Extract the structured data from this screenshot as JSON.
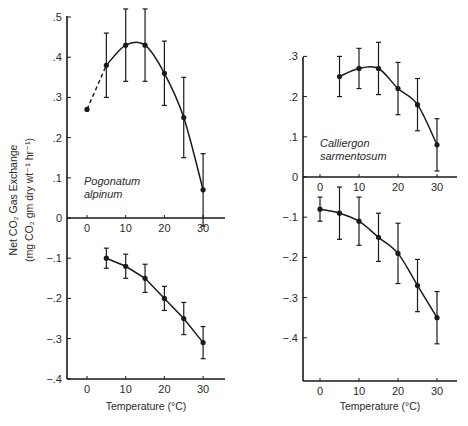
{
  "figure": {
    "ylabel_line1": "Net CO₂ Gas Exchange",
    "ylabel_line2": "(mg CO₂ gm dry wt⁻¹ hr⁻¹)",
    "xlabel": "Temperature (°C)"
  },
  "chart_data": [
    {
      "type": "line",
      "panel": "left",
      "title": "Pogonatum alpinum",
      "species_line1": "Pogonatum",
      "species_line2": "alpinum",
      "xlabel": "Temperature (°C)",
      "ylabel": "Net CO2 Gas Exchange (mg CO2 gm dry wt-1 hr-1)",
      "xlim": [
        -5,
        35
      ],
      "ylim": [
        -0.4,
        0.5
      ],
      "x_ticks": [
        "0",
        "10",
        "20",
        "30"
      ],
      "y_ticks": [
        ".5",
        ".4",
        ".3",
        ".2",
        ".1",
        "0",
        "-.1",
        "-.2",
        "-.3",
        "-.4"
      ],
      "grid": false,
      "series": [
        {
          "name": "Net photosynthesis (light)",
          "x": [
            0,
            5,
            10,
            15,
            20,
            25,
            30
          ],
          "values": [
            0.27,
            0.38,
            0.43,
            0.43,
            0.36,
            0.25,
            0.07
          ],
          "error": [
            0,
            0.08,
            0.09,
            0.09,
            0.08,
            0.1,
            0.09
          ],
          "style": "smooth curve, dashed segment between 0 and 5"
        },
        {
          "name": "Dark respiration",
          "x": [
            5,
            10,
            15,
            20,
            25,
            30
          ],
          "values": [
            -0.1,
            -0.12,
            -0.15,
            -0.2,
            -0.25,
            -0.31
          ],
          "error": [
            0.025,
            0.03,
            0.035,
            0.03,
            0.04,
            0.04
          ],
          "style": "solid line"
        }
      ]
    },
    {
      "type": "line",
      "panel": "right",
      "title": "Calliergon sarmentosum",
      "species_line1": "Calliergon",
      "species_line2": "sarmentosum",
      "xlabel": "Temperature (°C)",
      "ylabel": "Net CO2 Gas Exchange (mg CO2 gm dry wt-1 hr-1)",
      "xlim": [
        -5,
        35
      ],
      "ylim": [
        -0.5,
        0.3
      ],
      "x_ticks": [
        "0",
        "10",
        "20",
        "30"
      ],
      "y_ticks": [
        ".3",
        ".2",
        ".1",
        "0",
        "-.1",
        "-.2",
        "-.3",
        "-.4"
      ],
      "grid": false,
      "series": [
        {
          "name": "Net photosynthesis (light)",
          "x": [
            5,
            10,
            15,
            20,
            25,
            30
          ],
          "values": [
            0.25,
            0.27,
            0.27,
            0.22,
            0.18,
            0.08
          ],
          "error": [
            0.05,
            0.05,
            0.065,
            0.065,
            0.065,
            0.065
          ],
          "style": "smooth curve"
        },
        {
          "name": "Dark respiration",
          "x": [
            0,
            5,
            10,
            15,
            20,
            25,
            30
          ],
          "values": [
            -0.08,
            -0.09,
            -0.11,
            -0.15,
            -0.19,
            -0.27,
            -0.35
          ],
          "error": [
            0.03,
            0.065,
            0.06,
            0.06,
            0.075,
            0.065,
            0.065
          ],
          "style": "smooth curve"
        }
      ]
    }
  ]
}
